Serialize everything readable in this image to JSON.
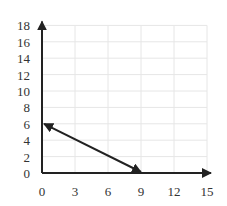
{
  "chart_data": {
    "type": "line",
    "title": "",
    "xlabel": "",
    "ylabel": "",
    "xlim": [
      0,
      15
    ],
    "ylim": [
      0,
      18
    ],
    "x_ticks": [
      0,
      3,
      6,
      9,
      12,
      15
    ],
    "y_ticks": [
      0,
      2,
      4,
      6,
      8,
      10,
      12,
      14,
      16,
      18
    ],
    "grid": true,
    "legend": null,
    "series": [
      {
        "name": "segment",
        "points": [
          [
            0,
            6
          ],
          [
            9,
            0
          ]
        ],
        "arrowheads": "both",
        "color": "#222222"
      }
    ],
    "axes_arrows": true
  },
  "colors": {
    "axis": "#222222",
    "grid": "#e6e6e6",
    "line": "#222222",
    "tick_text": "#333333"
  }
}
